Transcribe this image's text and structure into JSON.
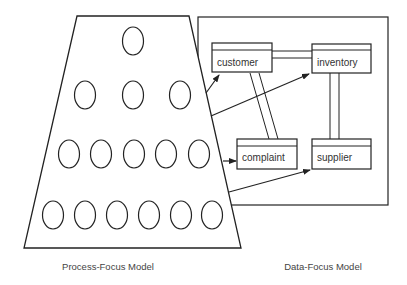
{
  "diagram": {
    "process_model": {
      "caption": "Process-Focus Model",
      "shape": "trapezoid",
      "rows": [
        {
          "count": 1
        },
        {
          "count": 3
        },
        {
          "count": 5
        },
        {
          "count": 6
        }
      ]
    },
    "data_model": {
      "caption": "Data-Focus Model",
      "entities": [
        {
          "id": "customer",
          "label": "customer"
        },
        {
          "id": "inventory",
          "label": "inventory"
        },
        {
          "id": "complaint",
          "label": "complaint"
        },
        {
          "id": "supplier",
          "label": "supplier"
        }
      ],
      "relationships": [
        {
          "from": "customer",
          "to": "inventory",
          "style": "double-line"
        },
        {
          "from": "customer",
          "to": "complaint",
          "style": "double-line"
        },
        {
          "from": "inventory",
          "to": "supplier",
          "style": "double-line"
        }
      ]
    },
    "arrows": [
      {
        "from": "process-model",
        "to": "customer"
      },
      {
        "from": "process-model",
        "to": "inventory"
      },
      {
        "from": "process-model",
        "to": "complaint"
      },
      {
        "from": "process-model",
        "to": "supplier"
      }
    ],
    "colors": {
      "stroke": "#222222",
      "text": "#333333",
      "background": "#ffffff"
    }
  }
}
